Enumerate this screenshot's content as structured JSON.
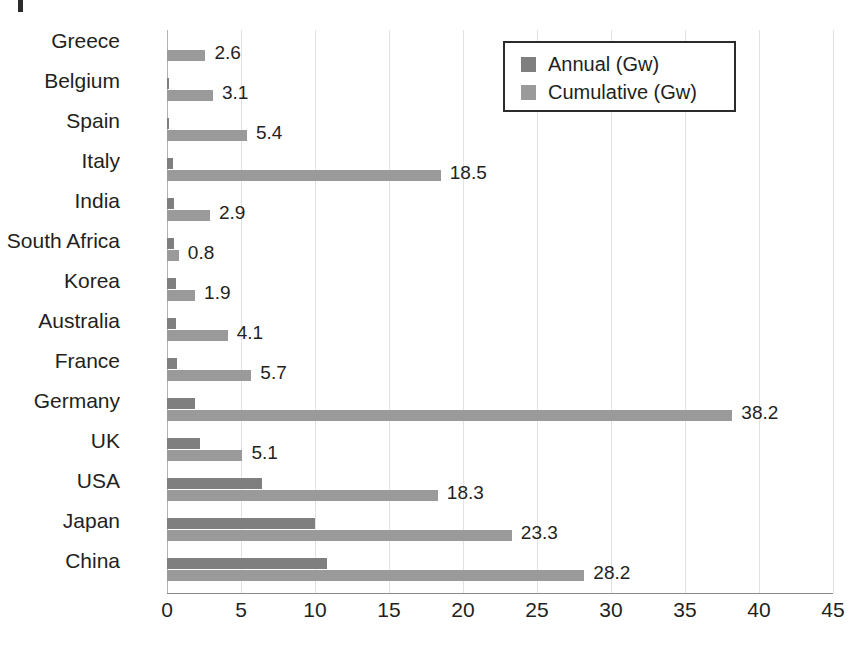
{
  "chart_data": {
    "type": "bar",
    "orientation": "horizontal",
    "title": "",
    "subtitle": "",
    "xlabel": "",
    "ylabel": "",
    "xlim": [
      0,
      45
    ],
    "xticks": [
      0,
      5,
      10,
      15,
      20,
      25,
      30,
      35,
      40,
      45
    ],
    "xtick_labels": [
      "0",
      "5",
      "10",
      "15",
      "20",
      "25",
      "30",
      "35",
      "40",
      "45"
    ],
    "grid": "vertical",
    "legend_position": "top-right",
    "categories": [
      "Greece",
      "Belgium",
      "Spain",
      "Italy",
      "India",
      "South Africa",
      "Korea",
      "Australia",
      "France",
      "Germany",
      "UK",
      "USA",
      "Japan",
      "China"
    ],
    "series": [
      {
        "name": "Annual (Gw)",
        "color": "#7f7f7f",
        "values": [
          0.0,
          0.15,
          0.15,
          0.4,
          0.5,
          0.5,
          0.6,
          0.6,
          0.65,
          1.9,
          2.2,
          6.4,
          10.0,
          10.8
        ],
        "labels": [
          "",
          "",
          "",
          "",
          "",
          "",
          "",
          "",
          "",
          "",
          "",
          "",
          "",
          ""
        ]
      },
      {
        "name": "Cumulative (Gw)",
        "color": "#9a9a9a",
        "values": [
          2.6,
          3.1,
          5.4,
          18.5,
          2.9,
          0.8,
          1.9,
          4.1,
          5.7,
          38.2,
          5.1,
          18.3,
          23.3,
          28.2
        ],
        "labels": [
          "2.6",
          "3.1",
          "5.4",
          "18.5",
          "2.9",
          "0.8",
          "1.9",
          "4.1",
          "5.7",
          "38.2",
          "5.1",
          "18.3",
          "23.3",
          "28.2"
        ]
      }
    ]
  },
  "legend": {
    "entries": [
      {
        "label": "Annual (Gw)",
        "color": "#7f7f7f"
      },
      {
        "label": "Cumulative (Gw)",
        "color": "#9a9a9a"
      }
    ]
  }
}
